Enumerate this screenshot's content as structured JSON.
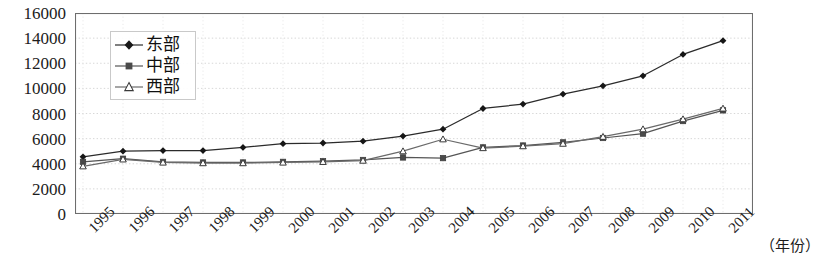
{
  "chart_data": {
    "type": "line",
    "title": "",
    "xlabel": "（年份）",
    "ylabel": "",
    "categories": [
      "1995",
      "1996",
      "1997",
      "1998",
      "1999",
      "2000",
      "2001",
      "2002",
      "2003",
      "2004",
      "2005",
      "2006",
      "2007",
      "2008",
      "2009",
      "2010",
      "2011"
    ],
    "ylim": [
      0,
      16000
    ],
    "yticks": [
      "0",
      "2000",
      "4000",
      "6000",
      "8000",
      "10000",
      "12000",
      "14000",
      "16000"
    ],
    "ytick_values": [
      0,
      2000,
      4000,
      6000,
      8000,
      10000,
      12000,
      14000,
      16000
    ],
    "grid": true,
    "grid_style": "dotted-horizontal",
    "legend_position": "upper-left-inside",
    "series": [
      {
        "name": "东部",
        "marker": "filled-diamond",
        "color": "#2b2b2b",
        "values": [
          4550,
          5000,
          5050,
          5050,
          5300,
          5600,
          5650,
          5800,
          6200,
          6750,
          8400,
          8750,
          9550,
          10200,
          11000,
          12700,
          13800
        ]
      },
      {
        "name": "中部",
        "marker": "filled-square",
        "color": "#555555",
        "values": [
          4150,
          4400,
          4150,
          4100,
          4100,
          4150,
          4200,
          4300,
          4500,
          4450,
          5300,
          5450,
          5700,
          6050,
          6400,
          7400,
          8250
        ]
      },
      {
        "name": "西部",
        "marker": "open-triangle",
        "color": "#6a6a6a",
        "values": [
          3800,
          4350,
          4100,
          4050,
          4050,
          4100,
          4150,
          4250,
          5000,
          5950,
          5250,
          5400,
          5600,
          6150,
          6750,
          7550,
          8400
        ]
      }
    ]
  },
  "legend": {
    "items": [
      {
        "label": "东部"
      },
      {
        "label": "中部"
      },
      {
        "label": "西部"
      }
    ]
  },
  "axes": {
    "x_title": "（年份）"
  }
}
